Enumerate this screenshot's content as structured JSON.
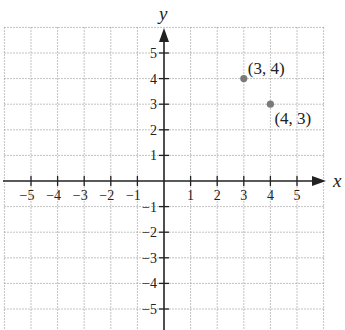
{
  "chart_data": {
    "type": "scatter",
    "title": "",
    "xlabel": "x",
    "ylabel": "y",
    "xlim": [
      -6,
      6
    ],
    "ylim": [
      -6,
      6
    ],
    "grid": true,
    "x_ticks": [
      -5,
      -4,
      -3,
      -2,
      -1,
      1,
      2,
      3,
      4,
      5
    ],
    "y_ticks": [
      5,
      4,
      3,
      2,
      1,
      -1,
      -2,
      -3,
      -4,
      -5
    ],
    "x_tick_labels": [
      "−5",
      "−4",
      "−3",
      "−2",
      "−1",
      "1",
      "2",
      "3",
      "4",
      "5"
    ],
    "y_tick_labels": [
      "5",
      "4",
      "3",
      "2",
      "1",
      "−1",
      "−2",
      "−3",
      "−4",
      "−5"
    ],
    "points": [
      {
        "x": 3,
        "y": 4,
        "label": "(3, 4)",
        "label_position": "upper-right"
      },
      {
        "x": 4,
        "y": 3,
        "label": "(4, 3)",
        "label_position": "lower-right"
      }
    ]
  },
  "colors": {
    "axis": "#222222",
    "grid": "#9a9a9a",
    "point": "#7a7a7a",
    "text": "#222222"
  },
  "axes": {
    "x_label": "x",
    "y_label": "y"
  }
}
